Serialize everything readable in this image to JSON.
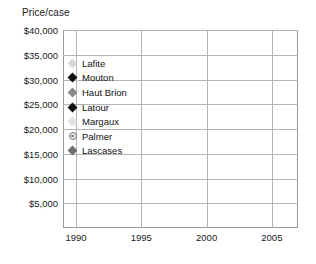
{
  "axis_title": "Price/case",
  "legend": {
    "items": [
      {
        "label": "Lafite",
        "color": "#d8d8d8",
        "marker": "diamond"
      },
      {
        "label": "Mouton",
        "color": "#111111",
        "marker": "diamond"
      },
      {
        "label": "Haut Brion",
        "color": "#8a8a8a",
        "marker": "diamond"
      },
      {
        "label": "Latour",
        "color": "#111111",
        "marker": "diamond"
      },
      {
        "label": "Margaux",
        "color": "#e2e2e2",
        "marker": "diamond"
      },
      {
        "label": "Palmer",
        "color": "#808080",
        "marker": "circle-dot"
      },
      {
        "label": "Lascases",
        "color": "#6e6e6e",
        "marker": "diamond"
      }
    ]
  },
  "chart_data": {
    "type": "line",
    "title": "",
    "xlabel": "",
    "ylabel": "Price/case",
    "xlim": [
      1989,
      2007
    ],
    "ylim": [
      0,
      40000
    ],
    "ytick_labels": [
      "$40,000",
      "$35,000",
      "$30,000",
      "$25,000",
      "$20,000",
      "$15,000",
      "$10,000",
      "$5,000"
    ],
    "ytick_values": [
      40000,
      35000,
      30000,
      25000,
      20000,
      15000,
      10000,
      5000
    ],
    "xtick_labels": [
      "1990",
      "1995",
      "2000",
      "2005"
    ],
    "xtick_values": [
      1990,
      1995,
      2000,
      2005
    ],
    "grid": true,
    "legend_position": "inside-upper-left",
    "x": [
      1989,
      1990,
      1991,
      1992,
      1993,
      1994,
      1995,
      1996,
      1997,
      1998,
      1999,
      2000,
      2001,
      2002,
      2003,
      2004,
      2005,
      2006,
      2007
    ],
    "series": [
      {
        "name": "Latour",
        "color": "#111111",
        "marker": "diamond",
        "values": [
          4100,
          6700,
          5200,
          5100,
          5100,
          6400,
          10300,
          12200,
          14300,
          16200,
          18000,
          18100,
          21700,
          17000,
          17500,
          18600,
          18600,
          27700,
          34000
        ]
      },
      {
        "name": "Palmer",
        "color": "#808080",
        "marker": "circle-dot",
        "values": [
          4600,
          4900,
          4500,
          4400,
          3800,
          5000,
          5800,
          6400,
          6800,
          6500,
          6200,
          7200,
          9900,
          12400,
          10200,
          8600,
          16100,
          17300,
          24600
        ]
      },
      {
        "name": "Lascases",
        "color": "#6e6e6e",
        "marker": "diamond",
        "values": [
          1700,
          1700,
          1550,
          1400,
          1600,
          1600,
          1550,
          1700,
          2000,
          2200,
          2400,
          2500,
          2350,
          2500,
          2300,
          2500,
          2900,
          3600,
          7500
        ]
      },
      {
        "name": "Mouton",
        "color": "#2a2a2a",
        "marker": "diamond",
        "values": [
          null,
          null,
          null,
          null,
          null,
          null,
          null,
          null,
          null,
          null,
          null,
          null,
          null,
          null,
          null,
          null,
          null,
          null,
          19000
        ]
      },
      {
        "name": "Lafite",
        "color": "#d2d2d2",
        "marker": "diamond",
        "values": [
          4300,
          4600,
          4400,
          4200,
          4300,
          4800,
          9200,
          6900,
          8000,
          8000,
          13000,
          9000,
          12800,
          11700,
          14800,
          12300,
          12000,
          11000,
          21000
        ]
      },
      {
        "name": "Haut Brion",
        "color": "#b9b9b9",
        "marker": "diamond",
        "values": [
          4200,
          4300,
          4100,
          4000,
          3900,
          4400,
          5000,
          5200,
          5300,
          5400,
          5500,
          5600,
          7000,
          6800,
          7200,
          6400,
          6300,
          6600,
          9700
        ]
      },
      {
        "name": "Margaux",
        "color": "#e0e0e0",
        "marker": "diamond",
        "values": [
          4200,
          4500,
          4300,
          4100,
          4000,
          4600,
          5400,
          5600,
          5700,
          5900,
          6300,
          6600,
          8300,
          8100,
          8600,
          7800,
          7600,
          7400,
          8900
        ]
      }
    ]
  }
}
